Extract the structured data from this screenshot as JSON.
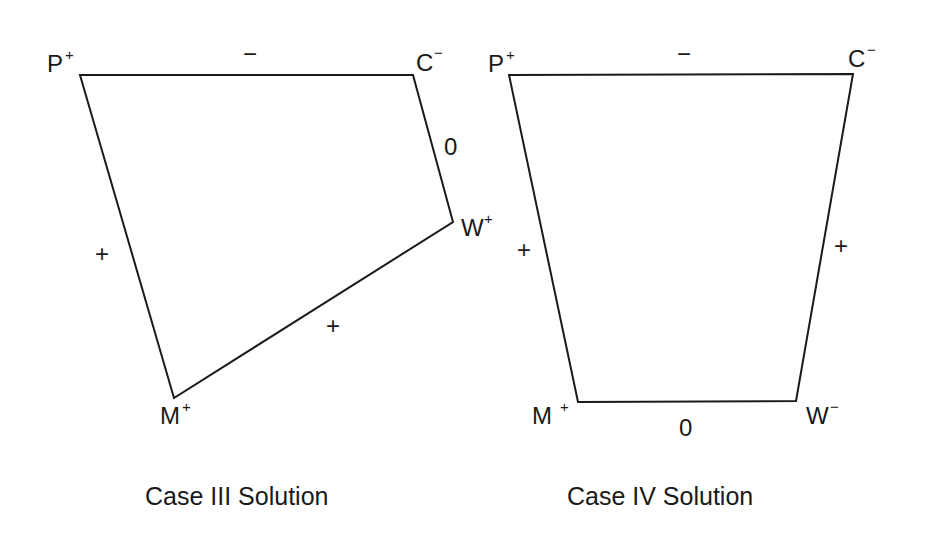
{
  "diagrams": [
    {
      "caption": "Case III Solution",
      "nodes": [
        {
          "name": "P",
          "sign": "+"
        },
        {
          "name": "C",
          "sign": "−"
        },
        {
          "name": "W",
          "sign": "+"
        },
        {
          "name": "M",
          "sign": "+"
        }
      ],
      "edges": [
        {
          "from": "P",
          "to": "C",
          "sign": "−"
        },
        {
          "from": "C",
          "to": "W",
          "sign": "0"
        },
        {
          "from": "W",
          "to": "M",
          "sign": "+"
        },
        {
          "from": "M",
          "to": "P",
          "sign": "+"
        }
      ]
    },
    {
      "caption": "Case IV Solution",
      "nodes": [
        {
          "name": "P",
          "sign": "+"
        },
        {
          "name": "C",
          "sign": "−"
        },
        {
          "name": "W",
          "sign": "−"
        },
        {
          "name": "M",
          "sign": "+"
        }
      ],
      "edges": [
        {
          "from": "P",
          "to": "C",
          "sign": "−"
        },
        {
          "from": "C",
          "to": "W",
          "sign": "+"
        },
        {
          "from": "W",
          "to": "M",
          "sign": "0"
        },
        {
          "from": "M",
          "to": "P",
          "sign": "+"
        }
      ]
    }
  ]
}
